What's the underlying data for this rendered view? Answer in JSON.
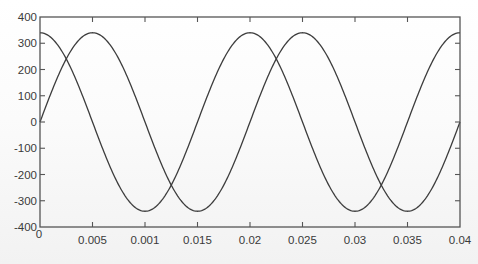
{
  "chart_data": {
    "type": "line",
    "title": "",
    "xlabel": "",
    "ylabel": "",
    "xlim": [
      0,
      0.04
    ],
    "ylim": [
      -400,
      400
    ],
    "grid": false,
    "legend": null,
    "x_ticks": [
      0,
      0.005,
      0.01,
      0.015,
      0.02,
      0.025,
      0.03,
      0.035,
      0.04
    ],
    "x_tick_labels": [
      "0",
      "0.005",
      "0.001",
      "0.015",
      "0.02",
      "0.025",
      "0.03",
      "0.035",
      "0.04"
    ],
    "y_ticks": [
      400,
      300,
      200,
      100,
      0,
      -100,
      -200,
      -300,
      -400
    ],
    "y_tick_labels": [
      "400",
      "300",
      "200",
      "100",
      "0",
      "-100",
      "-200",
      "-300",
      "-400"
    ],
    "series": [
      {
        "name": "cosine",
        "function": "340*cos(2*pi*50*t)",
        "amplitude": 340,
        "frequency_hz": 50,
        "phase_deg": 90,
        "x": [
          0,
          0.005,
          0.01,
          0.015,
          0.02,
          0.025,
          0.03,
          0.035,
          0.04
        ],
        "values": [
          340,
          0,
          -340,
          0,
          340,
          0,
          -340,
          0,
          340
        ]
      },
      {
        "name": "sine",
        "function": "340*sin(2*pi*50*t)",
        "amplitude": 340,
        "frequency_hz": 50,
        "phase_deg": 0,
        "x": [
          0,
          0.005,
          0.01,
          0.015,
          0.02,
          0.025,
          0.03,
          0.035,
          0.04
        ],
        "values": [
          0,
          340,
          0,
          -340,
          0,
          340,
          0,
          -340,
          0
        ]
      }
    ]
  }
}
